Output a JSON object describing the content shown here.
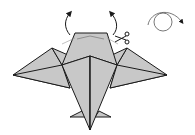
{
  "diagram": {
    "type": "origami-instruction",
    "colors": {
      "paper_fill": "#c8c8c8",
      "stroke": "#1a1a1a",
      "background": "#ffffff"
    },
    "symbols": [
      {
        "name": "fold-up-arrow-left",
        "meaning": "lift flap up"
      },
      {
        "name": "fold-up-arrow-right",
        "meaning": "lift flap up"
      },
      {
        "name": "scissors-icon",
        "meaning": "cut"
      },
      {
        "name": "turn-over-icon",
        "meaning": "turn model over"
      }
    ]
  }
}
